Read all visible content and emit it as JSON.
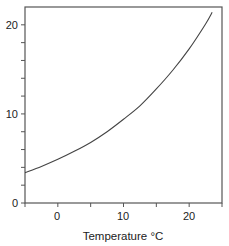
{
  "chart_data": {
    "type": "line",
    "title": "",
    "xlabel": "Temperature °C",
    "ylabel": "",
    "xlim": [
      -5,
      25
    ],
    "ylim": [
      0,
      22
    ],
    "x_ticks_major": [
      0,
      10,
      20
    ],
    "x_ticks_minor": [
      5,
      15
    ],
    "y_ticks_major": [
      0,
      10,
      20
    ],
    "y_ticks_minor": [
      2,
      4,
      6,
      8,
      12,
      14,
      16,
      18
    ],
    "grid": false,
    "legend": null,
    "series": [
      {
        "name": "curve",
        "x": [
          -5,
          -2.5,
          0,
          2.5,
          5,
          7.5,
          10,
          12.5,
          15,
          17.5,
          20,
          22.5,
          23.5
        ],
        "values": [
          3.4,
          4.1,
          4.9,
          5.8,
          6.8,
          8.0,
          9.4,
          10.9,
          12.8,
          14.9,
          17.3,
          20.1,
          21.4
        ]
      }
    ]
  },
  "labels": {
    "xlabel": "Temperature °C",
    "x_tick_0": "0",
    "x_tick_10": "10",
    "x_tick_20": "20",
    "y_tick_0": "0",
    "y_tick_10": "10",
    "y_tick_20": "20"
  },
  "colors": {
    "axis": "#555555",
    "line": "#444444"
  }
}
